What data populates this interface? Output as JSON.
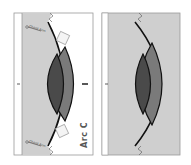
{
  "figure": {
    "left_panel": {
      "label": "Arc C",
      "annotations": [
        {
          "text": "Chord Arm",
          "position": "top"
        },
        {
          "text": "Chord Arm",
          "position": "bottom"
        }
      ]
    },
    "right_panel": {}
  },
  "colors": {
    "background": "#ffffff",
    "panel_fill": "#cfcfcf",
    "outer_lens": "#7a7a7a",
    "inner_lens": "#4a4a4a",
    "stroke": "#111111",
    "frame": "#9a9a9a",
    "label": "#555555"
  }
}
